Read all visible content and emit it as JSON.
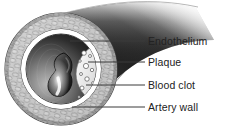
{
  "figure": {
    "background_color": "#ffffff",
    "text_color": "#222222",
    "leader_line_color": "#3a3a3a"
  },
  "callouts": [
    {
      "id": "endothelium",
      "label": "Endothelium",
      "leader_start_x": 70,
      "leader_start_y": 41,
      "leader_end_x": 145,
      "leader_end_y": 41,
      "text_x": 148,
      "text_y": 36
    },
    {
      "id": "plaque",
      "label": "Plaque",
      "leader_start_x": 88,
      "leader_start_y": 62,
      "leader_end_x": 145,
      "leader_end_y": 62,
      "text_x": 148,
      "text_y": 57
    },
    {
      "id": "blood-clot",
      "label": "Blood clot",
      "leader_start_x": 86,
      "leader_start_y": 85,
      "leader_end_x": 145,
      "leader_end_y": 85,
      "text_x": 148,
      "text_y": 80
    },
    {
      "id": "artery-wall",
      "label": "Artery wall",
      "leader_start_x": 72,
      "leader_start_y": 107,
      "leader_end_x": 145,
      "leader_end_y": 107,
      "text_x": 148,
      "text_y": 102
    }
  ],
  "anatomy": {
    "tube_body_name": "artery-tube-body",
    "outer_wall_name": "artery-wall-ring",
    "endothelium_name": "endothelium-ring",
    "lumen_name": "artery-lumen",
    "plaque_name": "plaque-mass",
    "clot_name": "blood-clot-mass",
    "wall_texture_fill": "#c9c9c9",
    "wall_texture_stroke": "#555555",
    "endothelium_fill": "#ffffff",
    "lumen_dark": "#1c1c1c",
    "lumen_light": "#9a9a9a",
    "plaque_fill": "#f2f2f2",
    "clot_fill": "#3c3c3c"
  }
}
